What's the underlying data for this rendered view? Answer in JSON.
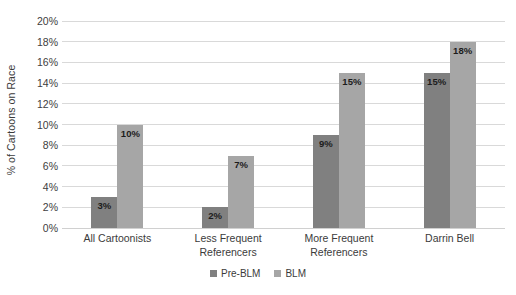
{
  "chart_data": {
    "type": "bar",
    "title": "",
    "xlabel": "",
    "ylabel": "% of Cartoons on Race",
    "ylim": [
      0,
      20
    ],
    "ytick_step": 2,
    "grid": true,
    "legend_position": "bottom",
    "categories": [
      "All Cartoonists",
      "Less Frequent Referencers",
      "More Frequent Referencers",
      "Darrin Bell"
    ],
    "category_lines": [
      [
        "All Cartoonists",
        ""
      ],
      [
        "Less Frequent",
        "Referencers"
      ],
      [
        "More Frequent",
        "Referencers"
      ],
      [
        "Darrin Bell",
        ""
      ]
    ],
    "ytick_labels": [
      "0%",
      "2%",
      "4%",
      "6%",
      "8%",
      "10%",
      "12%",
      "14%",
      "16%",
      "18%",
      "20%"
    ],
    "series": [
      {
        "name": "Pre-BLM",
        "color": "#808080",
        "values": [
          3,
          2,
          9,
          15
        ],
        "value_labels": [
          "3%",
          "2%",
          "9%",
          "15%"
        ]
      },
      {
        "name": "BLM",
        "color": "#a6a6a6",
        "values": [
          10,
          7,
          15,
          18
        ],
        "value_labels": [
          "10%",
          "7%",
          "15%",
          "18%"
        ]
      }
    ]
  },
  "legend": {
    "items": [
      {
        "label": "Pre-BLM",
        "color": "#808080"
      },
      {
        "label": "BLM",
        "color": "#a6a6a6"
      }
    ]
  },
  "colors": {
    "pre_blm": "#808080",
    "blm": "#a6a6a6",
    "gridline": "#d9d9d9",
    "text": "#3b3b3b",
    "background": "#ffffff"
  }
}
